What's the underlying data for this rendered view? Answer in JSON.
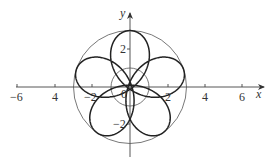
{
  "chart_data": {
    "type": "line",
    "title": "",
    "xlabel": "x",
    "ylabel": "y",
    "xlim": [
      -6.5,
      7
    ],
    "ylim": [
      -4.5,
      4.5
    ],
    "grid": false,
    "legend": null,
    "x_ticks": [
      -6,
      -4,
      -2,
      2,
      4,
      6
    ],
    "x_tick_labels": [
      "−6",
      "4",
      "−2",
      "2",
      "4",
      "6"
    ],
    "y_ticks": [
      2,
      -2
    ],
    "y_tick_labels": [
      "2",
      "−2"
    ],
    "origin_label": "0",
    "series": [
      {
        "name": "outer circle",
        "kind": "circle",
        "center": [
          0,
          0
        ],
        "radius": 3
      },
      {
        "name": "inner circle",
        "kind": "circle",
        "center": [
          0,
          0
        ],
        "radius": 1
      },
      {
        "name": "five-loop curve",
        "kind": "parametric",
        "description": "rose-like curve with 5 loops touching the outer circle (r=3) and pinching near the inner circle",
        "loop_directions_deg": [
          90,
          18,
          162,
          234,
          306
        ],
        "max_radius": 3
      }
    ]
  },
  "labels": {
    "x_axis": "x",
    "y_axis": "y",
    "origin": "0",
    "xt_m6": "−6",
    "xt_m4": "4",
    "xt_m2": "−2",
    "xt_p2": "2",
    "xt_p4": "4",
    "xt_p6": "6",
    "yt_p2": "2",
    "yt_m2": "−2"
  }
}
